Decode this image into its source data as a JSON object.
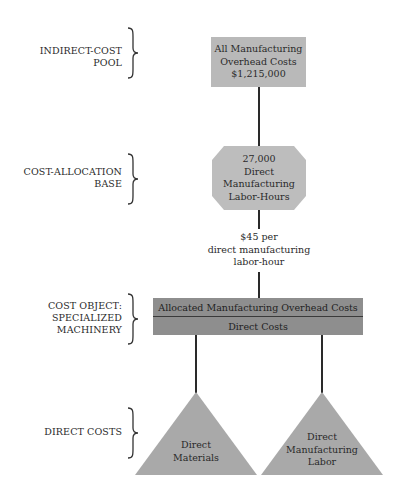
{
  "levels": [
    {
      "id": "indirect-cost-pool",
      "label_lines": [
        "INDIRECT-COST",
        "POOL"
      ]
    },
    {
      "id": "cost-allocation-base",
      "label_lines": [
        "COST-ALLOCATION",
        "BASE"
      ]
    },
    {
      "id": "cost-object",
      "label_lines": [
        "COST OBJECT:",
        "SPECIALIZED",
        "MACHINERY"
      ]
    },
    {
      "id": "direct-costs",
      "label_lines": [
        "DIRECT COSTS"
      ]
    }
  ],
  "pool_box": {
    "lines": [
      "All Manufacturing",
      "Overhead Costs",
      "$1,215,000"
    ]
  },
  "allocation_base": {
    "lines": [
      "27,000",
      "Direct",
      "Manufacturing",
      "Labor-Hours"
    ]
  },
  "rate": {
    "lines": [
      "$45 per",
      "direct manufacturing",
      "labor-hour"
    ]
  },
  "cost_object_bar": {
    "top_label": "Allocated Manufacturing Overhead Costs",
    "bottom_label": "Direct Costs"
  },
  "direct_cost_items": [
    {
      "lines": [
        "Direct",
        "Materials"
      ]
    },
    {
      "lines": [
        "Direct",
        "Manufacturing",
        "Labor"
      ]
    }
  ],
  "colors": {
    "box_fill": "#b9b9b9",
    "bar_fill": "#8e8e8e",
    "triangle_fill": "#a9a9a9",
    "line": "#2a2a2a"
  }
}
